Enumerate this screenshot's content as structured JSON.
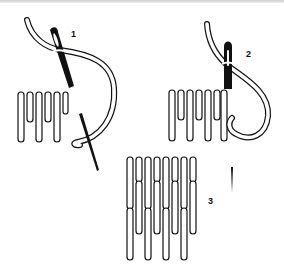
{
  "figure": {
    "title": "",
    "steps": [
      {
        "number": "1",
        "description": "needle inserted diagonally with thread looped around"
      },
      {
        "number": "2",
        "description": "needle held vertically with thread looped around"
      },
      {
        "number": "3",
        "description": "completed interlocking stitch rows with needle mark"
      }
    ]
  },
  "colors": {
    "ink": "#111111",
    "paper": "#ffffff"
  }
}
